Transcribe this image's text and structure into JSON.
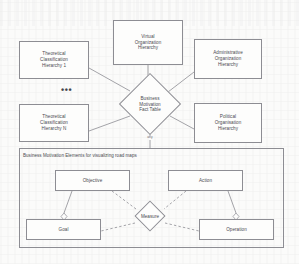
{
  "diagram": {
    "type": "entity-relationship-star-schema",
    "colors": {
      "stroke": "#8d8d93",
      "text": "#4a4a50",
      "page_background": "#fbfbfa",
      "node_fill": "#fdfdfc"
    },
    "fact_table": {
      "name": "business-motivation-fact-table",
      "label": "Business\nMotivation\nFact Table",
      "lines": [
        "Business",
        "Motivation",
        "Fact Table"
      ],
      "shape": "diamond"
    },
    "dimensions": [
      {
        "name": "theoretical-classification-hierarchy-1",
        "lines": [
          "Theoretical",
          "Classification",
          "Hierarchy 1"
        ],
        "shape": "rectangle"
      },
      {
        "name": "theoretical-classification-hierarchy-n",
        "lines": [
          "Theoretical",
          "Classification",
          "Hierarchy N"
        ],
        "shape": "rectangle"
      },
      {
        "name": "virtual-organization-hierarchy",
        "lines": [
          "Virtual",
          "Organization",
          "Hierarchy"
        ],
        "shape": "rectangle"
      },
      {
        "name": "administrative-organization-hierarchy",
        "lines": [
          "Administrative",
          "Organization",
          "Hierarchy"
        ],
        "shape": "rectangle"
      },
      {
        "name": "political-organisation-hierarchy",
        "lines": [
          "Political",
          "Organisation",
          "Hierarchy"
        ],
        "shape": "rectangle"
      }
    ],
    "ellipsis": "•••",
    "connector_label": "any",
    "container": {
      "name": "business-motivation-elements-container",
      "title": "Business Motivation Elements for visualizing road maps"
    },
    "elements": [
      {
        "name": "objective",
        "label": "Objective",
        "shape": "rectangle"
      },
      {
        "name": "action",
        "label": "Action",
        "shape": "rectangle"
      },
      {
        "name": "measure",
        "label": "Measure",
        "shape": "diamond"
      },
      {
        "name": "goal",
        "label": "Goal",
        "shape": "rectangle"
      },
      {
        "name": "operation",
        "label": "Operation",
        "shape": "rectangle"
      }
    ]
  }
}
